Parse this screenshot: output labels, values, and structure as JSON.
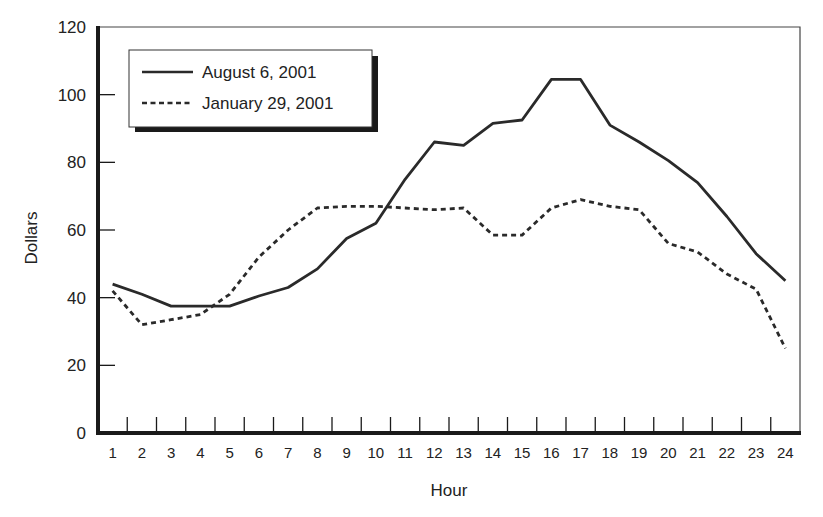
{
  "chart_data": {
    "type": "line",
    "title": "",
    "xlabel": "Hour",
    "ylabel": "Dollars",
    "ylim": [
      0,
      120
    ],
    "yticks": [
      0,
      20,
      40,
      60,
      80,
      100,
      120
    ],
    "x": [
      1,
      2,
      3,
      4,
      5,
      6,
      7,
      8,
      9,
      10,
      11,
      12,
      13,
      14,
      15,
      16,
      17,
      18,
      19,
      20,
      21,
      22,
      23,
      24
    ],
    "grid": false,
    "legend_position": "upper-left",
    "series": [
      {
        "name": "August 6, 2001",
        "style": "solid",
        "values": [
          44,
          41,
          37.5,
          37.5,
          37.5,
          40.5,
          43,
          48.5,
          57.5,
          62,
          75,
          86,
          85,
          91.5,
          92.5,
          104.5,
          104.5,
          91,
          86,
          80.5,
          74,
          64,
          53,
          45
        ]
      },
      {
        "name": "January 29, 2001",
        "style": "dashed",
        "values": [
          42,
          32,
          33.5,
          35,
          41,
          52,
          60,
          66.5,
          67,
          67,
          66.5,
          66,
          66.5,
          58.5,
          58.5,
          66.5,
          69,
          67,
          66,
          56,
          53.5,
          47,
          42.5,
          25
        ]
      }
    ]
  },
  "colors": {
    "line": "#2a2a2a",
    "axis": "#1a1a1a",
    "text": "#222222"
  }
}
